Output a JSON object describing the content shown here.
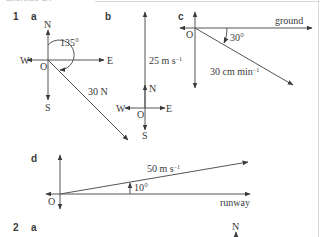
{
  "header": {
    "title_cut": "Exercise 1A"
  },
  "question1": {
    "number": "1",
    "a": {
      "label": "a",
      "compass": {
        "n": "N",
        "e": "E",
        "s": "S",
        "w": "W",
        "origin": "O"
      },
      "angle": "135°",
      "magnitude": "30 N"
    },
    "b": {
      "label": "b",
      "compass": {
        "n": "N",
        "e": "E",
        "s": "S",
        "w": "W",
        "origin": "O"
      },
      "magnitude": "25 m s",
      "unit_exp": "−1"
    },
    "c": {
      "label": "c",
      "origin": "O",
      "reference": "ground",
      "angle": "30°",
      "magnitude": "30 cm min",
      "unit_exp": "−1"
    },
    "d": {
      "label": "d",
      "origin": "O",
      "reference": "runway",
      "angle": "10°",
      "magnitude": "50 m s",
      "unit_exp": "−1"
    }
  },
  "question2": {
    "number": "2",
    "a": {
      "label": "a",
      "compass_n": "N"
    }
  },
  "colors": {
    "ink": "#3a3a3a",
    "line": "#555555"
  }
}
